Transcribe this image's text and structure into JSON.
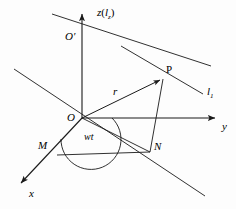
{
  "figure": {
    "background_color": "#fdfdfd",
    "stroke_color": "#1a1a1a",
    "labels": {
      "z_axis": "z",
      "z_axis_paren_open": "(",
      "z_axis_line": "l",
      "z_axis_line_sub": "z",
      "z_axis_paren_close": ")",
      "origin_prime": "O′",
      "point_p": "P",
      "line_l1": "l",
      "line_l1_sub": "1",
      "radius": "r",
      "origin": "O",
      "y_axis": "y",
      "angle": "wt",
      "point_m": "M",
      "point_n": "N",
      "x_axis": "x"
    }
  },
  "geometry": {
    "origin": {
      "x": 82,
      "y": 118
    },
    "z_axis_top": {
      "x": 82,
      "y": 11
    },
    "origin_prime": {
      "x": 82,
      "y": 40
    },
    "point_p": {
      "x": 163,
      "y": 78
    },
    "point_n": {
      "x": 150,
      "y": 152
    },
    "point_m": {
      "x": 57,
      "y": 155
    },
    "y_axis_end": {
      "x": 218,
      "y": 118
    },
    "x_axis_end": {
      "x": 17,
      "y": 186
    },
    "line_lz_start": {
      "x": 52,
      "y": 14
    },
    "line_lz_end": {
      "x": 211,
      "y": 66
    },
    "line_l1_start": {
      "x": 14,
      "y": 69
    },
    "line_l1_end": {
      "x": 203,
      "y": 94
    },
    "ground_line_start": {
      "x": 14,
      "y": 69
    },
    "ground_line_end": {
      "x": 205,
      "y": 196
    }
  }
}
